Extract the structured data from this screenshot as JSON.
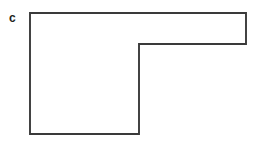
{
  "figure": {
    "label": "c",
    "label_style": "bold-lowercase",
    "background_color": "#ffffff",
    "stroke_color": "#3a3a3a",
    "fill_color": "#ffffff",
    "stroke_width": 1.9,
    "shape_name": "l-shaped-polygon",
    "canvas": {
      "width": 255,
      "height": 144
    },
    "vertices": [
      {
        "x": 30,
        "y": 13
      },
      {
        "x": 246,
        "y": 13
      },
      {
        "x": 246,
        "y": 44
      },
      {
        "x": 139,
        "y": 44
      },
      {
        "x": 139,
        "y": 134
      },
      {
        "x": 30,
        "y": 134
      }
    ],
    "vertex_count": 6,
    "edges": [
      {
        "name": "top-edge",
        "from": 0,
        "to": 1,
        "orientation": "horizontal",
        "length": 216
      },
      {
        "name": "right-edge",
        "from": 1,
        "to": 2,
        "orientation": "vertical",
        "length": 31
      },
      {
        "name": "inner-top-edge",
        "from": 2,
        "to": 3,
        "orientation": "horizontal",
        "length": 107
      },
      {
        "name": "inner-right-edge",
        "from": 3,
        "to": 4,
        "orientation": "vertical",
        "length": 90
      },
      {
        "name": "bottom-edge",
        "from": 4,
        "to": 5,
        "orientation": "horizontal",
        "length": 109
      },
      {
        "name": "left-edge",
        "from": 5,
        "to": 0,
        "orientation": "vertical",
        "length": 121
      }
    ],
    "points_path": "30,13 246,13 246,44 139,44 139,134 30,134",
    "label_position": {
      "x": 9,
      "y": 10
    }
  }
}
